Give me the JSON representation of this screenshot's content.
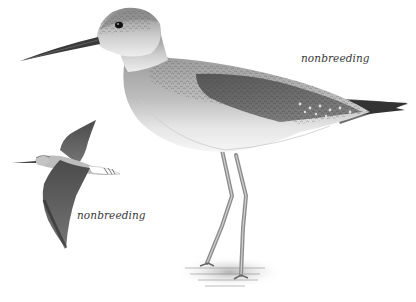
{
  "illustration": {
    "subject": "shorebird field-guide illustration",
    "background_color": "#ffffff",
    "figures": [
      {
        "id": "standing-bird",
        "pose": "standing in shallow water",
        "label": "nonbreeding"
      },
      {
        "id": "flying-bird",
        "pose": "in flight",
        "label": "nonbreeding"
      }
    ]
  },
  "labels": {
    "standing": "nonbreeding",
    "flying": "nonbreeding"
  }
}
